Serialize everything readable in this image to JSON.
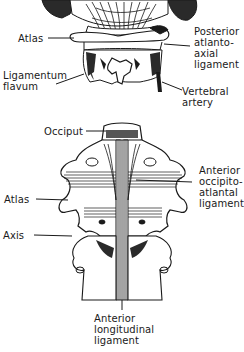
{
  "figure": {
    "top_view": {
      "description": "posterior view of upper cervical spine",
      "labels": [
        {
          "id": "atlas",
          "text": "Atlas"
        },
        {
          "id": "posterior_atlanto_axial",
          "text": "Posterior\natlanto-\naxial\nligament"
        },
        {
          "id": "ligamentum_flavum",
          "text": "Ligamentum\nflavum"
        },
        {
          "id": "vertebral_artery",
          "text": "Vertebral\nartery"
        }
      ]
    },
    "bottom_view": {
      "description": "anterior view of occiput, atlas and axis",
      "labels": [
        {
          "id": "occiput",
          "text": "Occiput"
        },
        {
          "id": "anterior_occipito_atlantal",
          "text": "Anterior\noccipito-\natlantal\nligament"
        },
        {
          "id": "atlas",
          "text": "Atlas"
        },
        {
          "id": "axis",
          "text": "Axis"
        },
        {
          "id": "anterior_longitudinal",
          "text": "Anterior\nlongitudinal\nligament"
        }
      ]
    },
    "colors": {
      "ink": "#1a1a1a",
      "background": "#ffffff"
    }
  }
}
